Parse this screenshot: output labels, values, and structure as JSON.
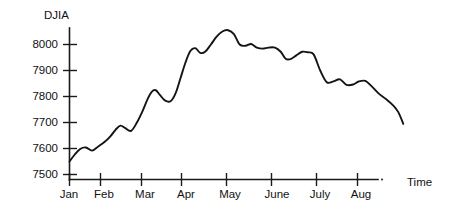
{
  "chart_data": {
    "type": "line",
    "title": "",
    "xlabel": "Time",
    "ylabel": "DJIA",
    "grid": false,
    "legend": "none",
    "ylim": [
      7440,
      8075
    ],
    "yticks": [
      7500,
      7600,
      7700,
      7800,
      7900,
      8000
    ],
    "ytick_labels": [
      "7500",
      "7600",
      "7700",
      "7800",
      "7900",
      "8000"
    ],
    "categories": [
      "Jan",
      "Feb",
      "Mar",
      "Apr",
      "May",
      "June",
      "July",
      "Aug"
    ],
    "xtick_labels": [
      "Jan",
      "Feb",
      "Mar",
      "Apr",
      "May",
      "June",
      "July",
      "Aug"
    ],
    "series": [
      {
        "name": "DJIA",
        "color": "#141414",
        "x": [
          0.0,
          0.12,
          0.26,
          0.4,
          0.55,
          0.7,
          0.85,
          1.0,
          1.12,
          1.24,
          1.36,
          1.5,
          1.64,
          1.78,
          1.9,
          2.0,
          2.1,
          2.2,
          2.32,
          2.46,
          2.58,
          2.7,
          2.82,
          2.94,
          3.06,
          3.18,
          3.3,
          3.44,
          3.58,
          3.72,
          3.86,
          4.0,
          4.14,
          4.28,
          4.42,
          4.56,
          4.7,
          4.84,
          5.0,
          5.14,
          5.26,
          5.38,
          5.52,
          5.66,
          5.8,
          5.94,
          6.1,
          6.26,
          6.42,
          6.58,
          6.74,
          6.9,
          7.04
        ],
        "values": [
          7550,
          7575,
          7598,
          7604,
          7592,
          7608,
          7625,
          7648,
          7672,
          7688,
          7678,
          7668,
          7700,
          7745,
          7790,
          7818,
          7824,
          7806,
          7785,
          7782,
          7812,
          7870,
          7930,
          7975,
          7986,
          7968,
          7972,
          8000,
          8030,
          8050,
          8055,
          8040,
          8000,
          7995,
          8002,
          7988,
          7984,
          7988,
          7988,
          7972,
          7945,
          7944,
          7958,
          7972,
          7970,
          7962,
          7900,
          7855,
          7858,
          7866,
          7845,
          7846,
          7858
        ]
      }
    ],
    "series_tail": {
      "x": [
        7.04,
        7.2,
        7.36,
        7.52,
        7.7,
        7.86,
        8.0,
        8.12
      ],
      "values": [
        7858,
        7860,
        7838,
        7812,
        7790,
        7768,
        7740,
        7695
      ]
    }
  },
  "labels": {
    "y_axis_title": "DJIA",
    "x_axis_title": "Time"
  }
}
